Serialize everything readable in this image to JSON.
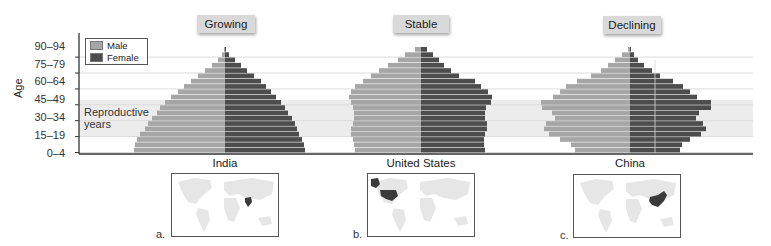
{
  "chart_data": {
    "type": "bar",
    "subtype": "population-pyramid",
    "ylabel": "Age",
    "age_groups": [
      "0–4",
      "5–9",
      "10–14",
      "15–19",
      "20–24",
      "25–29",
      "30–34",
      "35–39",
      "40–44",
      "45–49",
      "50–54",
      "55–59",
      "60–64",
      "65–69",
      "70–74",
      "75–79",
      "80–84",
      "85–89",
      "90–94",
      "95–99"
    ],
    "tick_labels": [
      "0–4",
      "15–19",
      "30–34",
      "45–49",
      "60–64",
      "75–79",
      "90–94"
    ],
    "legend": [
      {
        "name": "Male",
        "color": "#a6a6a6"
      },
      {
        "name": "Female",
        "color": "#4d4d4d"
      }
    ],
    "band": {
      "label": "Reproductive years",
      "from": "15–19",
      "to": "45–49",
      "color": "#ececec"
    },
    "units": "relative bar half-width (px)",
    "panels": [
      {
        "title": "Growing",
        "country": "India",
        "letter": "a.",
        "series": [
          {
            "name": "Male",
            "values": [
              91,
              90,
              88,
              85,
              80,
              77,
              73,
              68,
              65,
              60,
              54,
              47,
              41,
              34,
              27,
              20,
              13,
              7,
              3,
              1
            ]
          },
          {
            "name": "Female",
            "values": [
              80,
              79,
              77,
              74,
              72,
              70,
              67,
              63,
              60,
              56,
              51,
              46,
              41,
              36,
              29,
              22,
              16,
              10,
              4,
              1
            ]
          }
        ]
      },
      {
        "title": "Stable",
        "country": "United States",
        "letter": "b.",
        "series": [
          {
            "name": "Male",
            "values": [
              66,
              67,
              68,
              70,
              70,
              68,
              67,
              67,
              68,
              70,
              72,
              70,
              66,
              58,
              50,
              42,
              33,
              23,
              16,
              6
            ]
          },
          {
            "name": "Female",
            "values": [
              64,
              63,
              63,
              64,
              66,
              66,
              64,
              64,
              65,
              70,
              71,
              67,
              60,
              54,
              38,
              30,
              23,
              18,
              12,
              6
            ]
          }
        ]
      },
      {
        "title": "Declining",
        "country": "China",
        "letter": "c.",
        "series": [
          {
            "name": "Male",
            "values": [
              55,
              59,
              70,
              81,
              86,
              84,
              75,
              78,
              88,
              89,
              77,
              70,
              64,
              53,
              39,
              29,
              22,
              15,
              8,
              2
            ]
          },
          {
            "name": "Female",
            "values": [
              50,
              52,
              60,
              71,
              76,
              73,
              66,
              69,
              81,
              81,
              67,
              60,
              53,
              43,
              30,
              22,
              14,
              8,
              4,
              1
            ]
          }
        ]
      }
    ],
    "grid": true,
    "legend_position": "top-left"
  },
  "labels": {
    "axis_title": "Age",
    "legend_male": "Male",
    "legend_female": "Female",
    "repro_line1": "Reproductive",
    "repro_line2": "years",
    "panel_titles": [
      "Growing",
      "Stable",
      "Declining"
    ],
    "countries": [
      "India",
      "United States",
      "China"
    ],
    "letters": [
      "a.",
      "b.",
      "c."
    ],
    "ticks": [
      "0–4",
      "15–19",
      "30–34",
      "45–49",
      "60–64",
      "75–79",
      "90–94"
    ]
  },
  "colors": {
    "male": "#a6a6a6",
    "female": "#4d4d4d",
    "band": "#ececec",
    "grid": "#dcdcdc",
    "axis": "#333333",
    "map_land": "#e6e6e6",
    "map_highlight": "#3a3a3a"
  }
}
